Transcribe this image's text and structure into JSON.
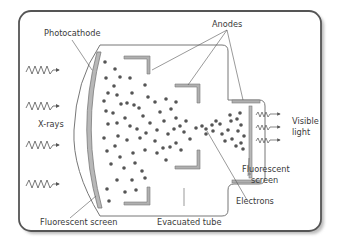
{
  "diagram": {
    "labels": {
      "photocathode": "Photocathode",
      "anodes": "Anodes",
      "xrays": "X-rays",
      "visible_line1": "Visible",
      "visible_line2": "light",
      "fluor_out_line1": "Fluorescent",
      "fluor_out_line2": "screen",
      "electrons": "Electrons",
      "fluor_in": "Fluorescent screen",
      "tube": "Evacuated tube"
    },
    "colors": {
      "frame": "#555555",
      "tube_outline": "#777777",
      "electrode": "#8a8a8a",
      "electrode_fill": "#b0b0b0",
      "electron_dot": "#555555",
      "text": "#3a3a3a"
    }
  }
}
